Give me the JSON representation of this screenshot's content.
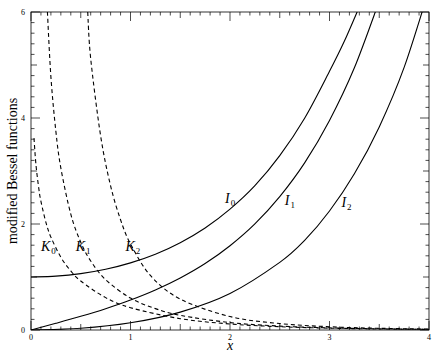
{
  "chart_data": {
    "type": "line",
    "title": "",
    "xlabel": "x",
    "ylabel": "modified Bessel functions",
    "xlim": [
      0,
      4
    ],
    "ylim": [
      0,
      6
    ],
    "grid": false,
    "legend": "inline curve labels",
    "x_ticks": [
      "0",
      "1",
      "2",
      "3",
      "4"
    ],
    "y_ticks": [
      "0",
      "2",
      "4",
      "6"
    ],
    "series": [
      {
        "name": "I0",
        "style": "solid",
        "label_pos": [
          1.95,
          2.4
        ],
        "x": [
          0,
          0.25,
          0.5,
          0.75,
          1.0,
          1.25,
          1.5,
          1.75,
          2.0,
          2.25,
          2.5,
          2.75,
          3.0,
          3.15,
          3.3
        ],
        "y": [
          1.0,
          1.0157,
          1.0635,
          1.1456,
          1.2661,
          1.4296,
          1.6467,
          1.9245,
          2.2796,
          2.7228,
          3.2898,
          3.9967,
          4.8808,
          5.452,
          6.1
        ]
      },
      {
        "name": "I1",
        "style": "solid",
        "label_pos": [
          2.55,
          2.35
        ],
        "x": [
          0,
          0.25,
          0.5,
          0.75,
          1.0,
          1.25,
          1.5,
          1.75,
          2.0,
          2.25,
          2.5,
          2.75,
          3.0,
          3.25,
          3.5
        ],
        "y": [
          0,
          0.126,
          0.2579,
          0.402,
          0.5652,
          0.7553,
          0.9817,
          1.2539,
          1.5906,
          2.0027,
          2.5167,
          3.1529,
          3.9534,
          4.947,
          6.2058
        ]
      },
      {
        "name": "I2",
        "style": "solid",
        "label_pos": [
          3.12,
          2.32
        ],
        "x": [
          0,
          0.5,
          1.0,
          1.5,
          2.0,
          2.5,
          2.75,
          3.0,
          3.25,
          3.5,
          3.75,
          4.0
        ],
        "y": [
          0,
          0.0319,
          0.1357,
          0.3378,
          0.6889,
          1.2764,
          1.6914,
          2.2452,
          2.947,
          3.832,
          4.9545,
          6.4222
        ]
      },
      {
        "name": "K0",
        "style": "dashed",
        "label_pos": [
          0.1,
          1.5
        ],
        "x": [
          0.03,
          0.05,
          0.08,
          0.1,
          0.15,
          0.2,
          0.3,
          0.4,
          0.5,
          0.75,
          1.0,
          1.5,
          2.0,
          2.5,
          3.0,
          3.5,
          4.0
        ],
        "y": [
          3.62,
          3.114,
          2.648,
          2.427,
          2.03,
          1.7527,
          1.3725,
          1.1145,
          0.9244,
          0.6106,
          0.421,
          0.2138,
          0.1139,
          0.0623,
          0.0347,
          0.0196,
          0.0112
        ]
      },
      {
        "name": "K1",
        "style": "dashed",
        "label_pos": [
          0.45,
          1.5
        ],
        "x": [
          0.165,
          0.2,
          0.25,
          0.3,
          0.4,
          0.5,
          0.6,
          0.75,
          1.0,
          1.25,
          1.5,
          2.0,
          2.5,
          3.0,
          3.5,
          4.0
        ],
        "y": [
          6.0,
          4.776,
          3.747,
          3.056,
          2.185,
          1.6564,
          1.3028,
          0.9496,
          0.6019,
          0.4035,
          0.2774,
          0.1399,
          0.0739,
          0.0402,
          0.0222,
          0.0125
        ]
      },
      {
        "name": "K2",
        "style": "dashed",
        "label_pos": [
          0.95,
          1.5
        ],
        "x": [
          0.57,
          0.6,
          0.7,
          0.8,
          0.9,
          1.0,
          1.2,
          1.5,
          2.0,
          2.5,
          3.0,
          3.5,
          4.0
        ],
        "y": [
          6.0,
          5.12,
          3.66,
          2.72,
          2.08,
          1.6248,
          1.029,
          0.5836,
          0.2538,
          0.1215,
          0.0615,
          0.0323,
          0.0174
        ]
      }
    ]
  }
}
